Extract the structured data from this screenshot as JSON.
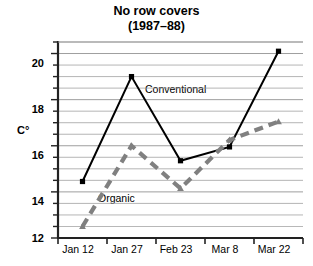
{
  "title": {
    "main": "No row covers",
    "sub": "(1987–88)"
  },
  "axis": {
    "y_label": "C°",
    "y_ticks": [
      "12",
      "14",
      "16",
      "18",
      "20"
    ],
    "x_ticks": [
      "Jan 12",
      "Jan 27",
      "Feb 23",
      "Mar 8",
      "Mar 22"
    ]
  },
  "annotations": {
    "conventional": "Conventional",
    "organic": "Organic"
  },
  "colors": {
    "conventional": "#000000",
    "organic": "#808080",
    "gridline": "#9a9a9a",
    "axis": "#222222",
    "background": "#ffffff"
  },
  "chart_data": {
    "type": "line",
    "title": "No row covers (1987–88)",
    "xlabel": "",
    "ylabel": "C°",
    "categories": [
      "Jan 12",
      "Jan 27",
      "Feb 23",
      "Mar 8",
      "Mar 22"
    ],
    "ylim": [
      12,
      20.5
    ],
    "y_major_ticks": [
      12,
      14,
      16,
      18,
      20
    ],
    "y_minor_step": 0.5,
    "grid": true,
    "legend": "inline-annotations",
    "series": [
      {
        "name": "Conventional",
        "values": [
          14.45,
          19.0,
          15.35,
          15.95,
          20.1
        ],
        "style": "solid",
        "color": "#000000",
        "marker": "square"
      },
      {
        "name": "Organic",
        "values": [
          12.5,
          16.0,
          14.15,
          16.25,
          17.05
        ],
        "style": "dashed",
        "color": "#808080",
        "marker": "triangle"
      }
    ]
  }
}
